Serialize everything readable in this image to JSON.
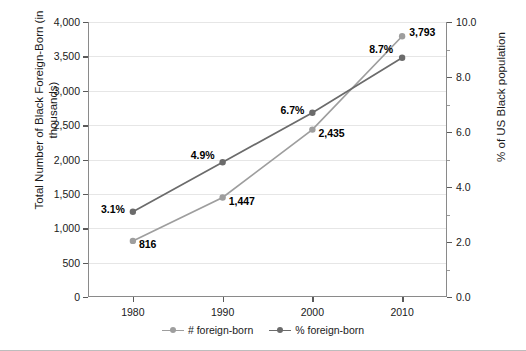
{
  "chart_data": {
    "type": "line",
    "title": "",
    "xlabel": "",
    "categories": [
      "1980",
      "1990",
      "2000",
      "2010"
    ],
    "x": [
      1980,
      1990,
      2000,
      2010
    ],
    "grid": true,
    "legend_position": "bottom",
    "series": [
      {
        "name": "# foreign-born",
        "axis": "left",
        "color": "#9e9e9e",
        "values": [
          816,
          1447,
          2435,
          3793
        ],
        "labels": [
          "816",
          "1,447",
          "2,435",
          "3,793"
        ]
      },
      {
        "name": "% foreign-born",
        "axis": "right",
        "color": "#6b6b6b",
        "values": [
          3.1,
          4.9,
          6.7,
          8.7
        ],
        "labels": [
          "3.1%",
          "4.9%",
          "6.7%",
          "8.7%"
        ]
      }
    ],
    "left_axis": {
      "label": "Total Number of Black Foreign-Born (in\nthousands)",
      "ylim": [
        0,
        4000
      ],
      "ticks": [
        0,
        500,
        1000,
        1500,
        2000,
        2500,
        3000,
        3500,
        4000
      ],
      "ticklabels": [
        "0",
        "500",
        "1,000",
        "1,500",
        "2,000",
        "2,500",
        "3,000",
        "3,500",
        "4,000"
      ]
    },
    "right_axis": {
      "label": "% of US Black population",
      "ylim": [
        0,
        10
      ],
      "ticks": [
        0,
        2,
        4,
        6,
        8,
        10
      ],
      "ticklabels": [
        "0.0",
        "2.0",
        "4.0",
        "6.0",
        "8.0",
        "10.0"
      ],
      "minor_ticks": [
        1,
        3,
        5,
        7,
        9
      ]
    }
  },
  "legend": {
    "items": [
      {
        "label": "# foreign-born",
        "color": "#9e9e9e"
      },
      {
        "label": "% foreign-born",
        "color": "#6b6b6b"
      }
    ]
  }
}
